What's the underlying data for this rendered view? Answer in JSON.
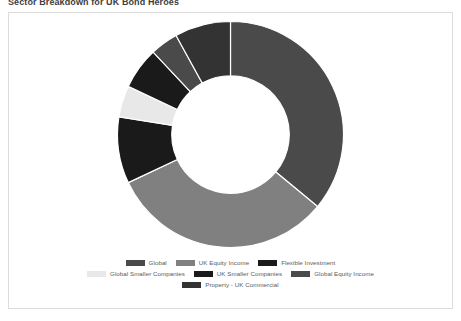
{
  "page": {
    "title": "Sector Breakdown for UK Bond Heroes",
    "background": "#ffffff",
    "card_border": "#dcdcdc"
  },
  "chart_data": {
    "type": "pie",
    "variant": "donut",
    "title": "Sector Breakdown for UK Bond Heroes",
    "xlabel": "",
    "ylabel": "",
    "legend_position": "bottom",
    "grid": false,
    "inner_radius_ratio": 0.52,
    "start_angle_deg": -90,
    "categories": [
      "Global",
      "UK Equity Income",
      "Flexible Investment",
      "Global Smaller Companies",
      "UK Smaller Companies",
      "Global Equity Income",
      "Property - UK Commercial"
    ],
    "values": [
      36.0,
      32.0,
      9.5,
      4.5,
      6.0,
      4.0,
      8.0
    ],
    "unit": "%",
    "colors": [
      "#4a4a4a",
      "#808080",
      "#1a1a1a",
      "#e8e8e8",
      "#1a1a1a",
      "#4a4a4a",
      "#333333"
    ],
    "slices": [
      {
        "label": "Global",
        "value": 36.0,
        "color": "#4a4a4a"
      },
      {
        "label": "UK Equity Income",
        "value": 32.0,
        "color": "#808080"
      },
      {
        "label": "Flexible Investment",
        "value": 9.5,
        "color": "#1a1a1a"
      },
      {
        "label": "Global Smaller Companies",
        "value": 4.5,
        "color": "#e8e8e8"
      },
      {
        "label": "UK Smaller Companies",
        "value": 6.0,
        "color": "#1a1a1a"
      },
      {
        "label": "Global Equity Income",
        "value": 4.0,
        "color": "#4a4a4a"
      },
      {
        "label": "Property - UK Commercial",
        "value": 8.0,
        "color": "#333333"
      }
    ]
  },
  "legend": {
    "rows": [
      [
        {
          "label": "Global",
          "color": "#4a4a4a"
        },
        {
          "label": "UK Equity Income",
          "color": "#808080"
        },
        {
          "label": "Flexible Investment",
          "color": "#1a1a1a"
        }
      ],
      [
        {
          "label": "Global Smaller Companies",
          "color": "#e8e8e8"
        },
        {
          "label": "UK Smaller Companies",
          "color": "#1a1a1a"
        },
        {
          "label": "Global Equity Income",
          "color": "#4a4a4a"
        }
      ],
      [
        {
          "label": "Property - UK Commercial",
          "color": "#333333"
        }
      ]
    ]
  }
}
